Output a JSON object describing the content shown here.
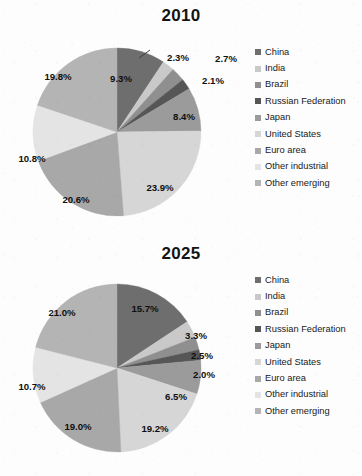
{
  "figure": {
    "background": "#fdfdfd",
    "label_color": "#0f0f0f"
  },
  "categories": [
    {
      "name": "China",
      "color": "#6e6e6e"
    },
    {
      "name": "India",
      "color": "#c9c9c9"
    },
    {
      "name": "Brazil",
      "color": "#8f8f8f"
    },
    {
      "name": "Russian Federation",
      "color": "#565656"
    },
    {
      "name": "Japan",
      "color": "#9b9b9b"
    },
    {
      "name": "United States",
      "color": "#d6d6d6"
    },
    {
      "name": "Euro area",
      "color": "#a8a8a8"
    },
    {
      "name": "Other industrial",
      "color": "#e4e4e4"
    },
    {
      "name": "Other emerging",
      "color": "#b4b4b4"
    }
  ],
  "charts": [
    {
      "title": "2010",
      "labels": [
        "9.3%",
        "2.3%",
        "2.7%",
        "2.1%",
        "8.4%",
        "23.9%",
        "20.6%",
        "10.8%",
        "19.8%"
      ],
      "values": [
        9.3,
        2.3,
        2.7,
        2.1,
        8.4,
        23.9,
        20.6,
        10.8,
        19.8
      ],
      "leader_line_for": "2.7%"
    },
    {
      "title": "2025",
      "labels": [
        "15.7%",
        "3.3%",
        "2.5%",
        "2.0%",
        "6.5%",
        "19.2%",
        "19.0%",
        "10.7%",
        "21.0%"
      ],
      "values": [
        15.7,
        3.3,
        2.5,
        2.0,
        6.5,
        19.2,
        19.0,
        10.7,
        21.0
      ],
      "leader_line_for": null
    }
  ],
  "chart_data": {
    "type": "pie",
    "legend_position": "right",
    "categories": [
      "China",
      "India",
      "Brazil",
      "Russian Federation",
      "Japan",
      "United States",
      "Euro area",
      "Other industrial",
      "Other emerging"
    ],
    "series": [
      {
        "name": "2010",
        "values": [
          9.3,
          2.3,
          2.7,
          2.1,
          8.4,
          23.9,
          20.6,
          10.8,
          19.8
        ],
        "data_labels": [
          "9.3%",
          "2.3%",
          "2.7%",
          "2.1%",
          "8.4%",
          "23.9%",
          "20.6%",
          "10.8%",
          "19.8%"
        ]
      },
      {
        "name": "2025",
        "values": [
          15.7,
          3.3,
          2.5,
          2.0,
          6.5,
          19.2,
          19.0,
          10.7,
          21.0
        ],
        "data_labels": [
          "15.7%",
          "3.3%",
          "2.5%",
          "2.0%",
          "6.5%",
          "19.2%",
          "19.0%",
          "10.7%",
          "21.0%"
        ]
      }
    ],
    "units": "percent",
    "start_angle_deg": 0,
    "direction": "clockwise",
    "grid": false
  }
}
